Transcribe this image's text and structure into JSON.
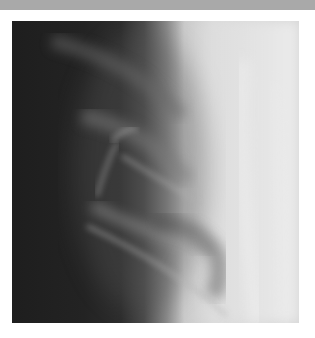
{
  "image": {
    "subject": "chest x-ray, ribs and shoulder region",
    "colors": {
      "top_bar": "#a9a9a9",
      "background": "#ffffff",
      "dark_region": "#1e1e1e",
      "bright_region": "#d9d9d9"
    }
  }
}
